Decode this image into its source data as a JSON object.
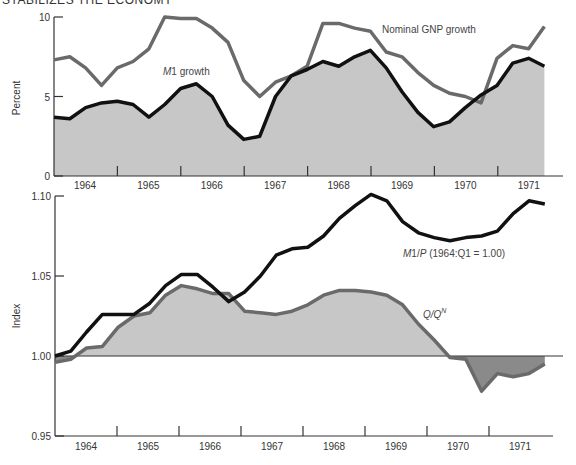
{
  "header": {
    "text": "STABILIZES THE ECONOMY"
  },
  "colors": {
    "positive_fill": "#c7c7c7",
    "negative_fill": "#8a8a8a",
    "dark_line": "#111111",
    "gray_line": "#6a6a6a",
    "axis": "#333333"
  },
  "chart_data": [
    {
      "type": "line",
      "title": "",
      "xlabel": "",
      "ylabel": "Percent",
      "ylim": [
        0,
        10
      ],
      "yticks": [
        0,
        5,
        10
      ],
      "x_tick_labels": [
        "1964",
        "1965",
        "1966",
        "1967",
        "1968",
        "1969",
        "1970",
        "1971"
      ],
      "x": "quarterly, 1964:Q1 to 1971:Q4",
      "grid": false,
      "series": [
        {
          "name": "Nominal GNP growth",
          "style": "gray-line",
          "values": [
            7.3,
            7.5,
            6.8,
            5.7,
            6.8,
            7.2,
            8.0,
            10.0,
            9.9,
            9.9,
            9.3,
            8.4,
            6.0,
            5.0,
            5.9,
            6.3,
            6.9,
            9.6,
            9.6,
            9.3,
            9.1,
            7.8,
            7.5,
            6.5,
            5.7,
            5.2,
            5.0,
            4.6,
            7.4,
            8.2,
            8.0,
            9.4
          ]
        },
        {
          "name": "M1 growth",
          "style": "black-line-filled",
          "values": [
            3.7,
            3.6,
            4.3,
            4.6,
            4.7,
            4.5,
            3.7,
            4.5,
            5.5,
            5.8,
            5.0,
            3.2,
            2.3,
            2.5,
            5.0,
            6.3,
            6.7,
            7.2,
            6.9,
            7.5,
            7.9,
            6.8,
            5.3,
            4.0,
            3.1,
            3.4,
            4.3,
            5.1,
            5.7,
            7.1,
            7.4,
            6.9
          ]
        }
      ],
      "annotations": [
        {
          "text": "Nominal GNP growth",
          "x": 382,
          "y": 33
        },
        {
          "text": "M1 growth",
          "x": 163,
          "y": 75
        }
      ]
    },
    {
      "type": "line",
      "title": "",
      "xlabel": "",
      "ylabel": "Index",
      "ylim": [
        0.95,
        1.1
      ],
      "yticks": [
        "0.95",
        "1.00",
        "1.05",
        "1.10"
      ],
      "x_tick_labels": [
        "1964",
        "1965",
        "1966",
        "1967",
        "1968",
        "1969",
        "1970",
        "1971"
      ],
      "x": "quarterly, 1964:Q1 to 1971:Q4",
      "baseline": 1.0,
      "grid": false,
      "series": [
        {
          "name": "M1/P (1964:Q1 = 1.00)",
          "style": "black-line",
          "values": [
            1.0,
            1.003,
            1.015,
            1.026,
            1.026,
            1.026,
            1.033,
            1.044,
            1.051,
            1.051,
            1.043,
            1.034,
            1.04,
            1.05,
            1.063,
            1.067,
            1.068,
            1.075,
            1.086,
            1.094,
            1.101,
            1.097,
            1.084,
            1.077,
            1.074,
            1.072,
            1.074,
            1.075,
            1.078,
            1.089,
            1.097,
            1.095
          ]
        },
        {
          "name": "Q/Q^N",
          "style": "gray-line-filled-to-baseline",
          "values": [
            0.996,
            0.998,
            1.005,
            1.006,
            1.018,
            1.025,
            1.027,
            1.038,
            1.044,
            1.042,
            1.039,
            1.039,
            1.028,
            1.027,
            1.026,
            1.028,
            1.032,
            1.038,
            1.041,
            1.041,
            1.04,
            1.038,
            1.032,
            1.02,
            1.01,
            0.999,
            0.998,
            0.978,
            0.989,
            0.987,
            0.989,
            0.995
          ]
        }
      ],
      "annotations": [
        {
          "text": "M1/P (1964:Q1 = 1.00)",
          "x": 403,
          "y": 257
        },
        {
          "text": "Q/QN",
          "x": 423,
          "y": 318
        }
      ]
    }
  ]
}
